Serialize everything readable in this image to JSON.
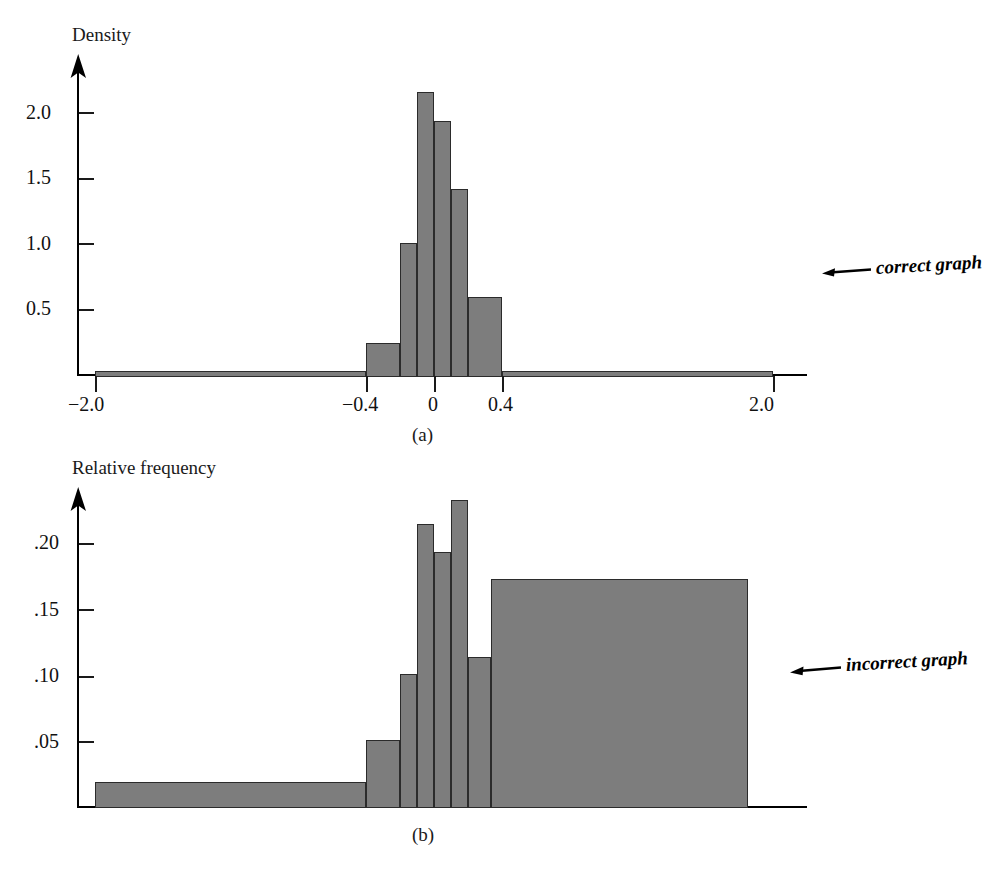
{
  "figure": {
    "panels": [
      {
        "id": "a",
        "subfig_label": "(a)",
        "y_axis_title": "Density",
        "annotation": "correct graph",
        "annotation_icon": "left-arrow-icon",
        "y_ticks": [
          "0.5",
          "1.0",
          "1.5",
          "2.0"
        ],
        "x_ticks": [
          "−2.0",
          "−0.4",
          "0",
          "0.4",
          "2.0"
        ]
      },
      {
        "id": "b",
        "subfig_label": "(b)",
        "y_axis_title": "Relative frequency",
        "annotation": "incorrect graph",
        "annotation_icon": "left-arrow-icon",
        "y_ticks": [
          ".05",
          ".10",
          ".15",
          ".20"
        ],
        "x_ticks": []
      }
    ]
  },
  "colors": {
    "bar_fill": "#7d7d7d",
    "bar_stroke": "#2b2b2b",
    "axis": "#000000",
    "text": "#111111"
  },
  "chart_data": [
    {
      "type": "bar",
      "title": "",
      "panel": "(a)",
      "xlabel": "",
      "ylabel": "Density",
      "ylim": [
        0,
        2.35
      ],
      "xlim": [
        -2.0,
        2.2
      ],
      "grid": false,
      "legend": "none",
      "annotations": [
        "correct graph"
      ],
      "xtick_values": [
        -2.0,
        -0.4,
        0,
        0.4,
        2.0
      ],
      "xtick_labels": [
        "−2.0",
        "−0.4",
        "0",
        "0.4",
        "2.0"
      ],
      "ytick_values": [
        0.5,
        1.0,
        1.5,
        2.0
      ],
      "ytick_labels": [
        "0.5",
        "1.0",
        "1.5",
        "2.0"
      ],
      "bin_edges": [
        -2.0,
        -0.4,
        -0.2,
        -0.1,
        0.0,
        0.1,
        0.2,
        0.4,
        2.0
      ],
      "values": [
        0.02,
        0.26,
        1.02,
        2.17,
        1.95,
        1.43,
        0.61,
        0.03
      ],
      "categories": [
        "-2.0 to -0.4",
        "-0.4 to -0.2",
        "-0.2 to -0.1",
        "-0.1 to 0.0",
        "0.0 to 0.1",
        "0.1 to 0.2",
        "0.2 to 0.4",
        "0.4 to 2.0"
      ]
    },
    {
      "type": "bar",
      "title": "",
      "panel": "(b)",
      "xlabel": "",
      "ylabel": "Relative frequency",
      "ylim": [
        0,
        0.245
      ],
      "xlim": [
        -2.0,
        2.2
      ],
      "grid": false,
      "legend": "none",
      "annotations": [
        "incorrect graph"
      ],
      "xtick_values": [],
      "xtick_labels": [],
      "ytick_values": [
        0.05,
        0.1,
        0.15,
        0.2
      ],
      "ytick_labels": [
        ".05",
        ".10",
        ".15",
        ".20"
      ],
      "bin_edges": [
        -2.0,
        -0.4,
        -0.2,
        -0.1,
        0.0,
        0.1,
        0.2,
        0.4,
        2.0
      ],
      "values": [
        0.02,
        0.052,
        0.102,
        0.217,
        0.195,
        0.235,
        0.115,
        0.175
      ],
      "categories": [
        "-2.0 to -0.4",
        "-0.4 to -0.2",
        "-0.2 to -0.1",
        "-0.1 to 0.0",
        "0.0 to 0.1",
        "0.1 to 0.2",
        "0.2 to 0.4",
        "0.4 to 2.0"
      ]
    }
  ]
}
